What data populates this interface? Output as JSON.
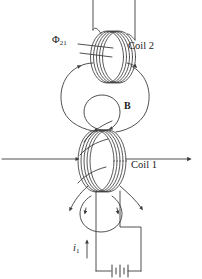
{
  "figure": {
    "background_color": "#ffffff",
    "line_color": "#3c3c3c",
    "label_color": "#1a1a1a"
  },
  "labels": {
    "coil2": "Coil 2",
    "coil1": "Coil 1",
    "flux_symbol": "Φ",
    "flux_subscript": "21",
    "field_symbol": "B",
    "current_symbol": "i",
    "current_subscript": "1"
  },
  "elements": {
    "coil2_name": "coil-2-winding",
    "coil1_name": "coil-1-winding",
    "axis_name": "magnetic-axis-line",
    "battery_name": "battery-symbol",
    "flux_lines_name": "magnetic-field-lines",
    "current_arrow_name": "current-direction-arrow"
  }
}
